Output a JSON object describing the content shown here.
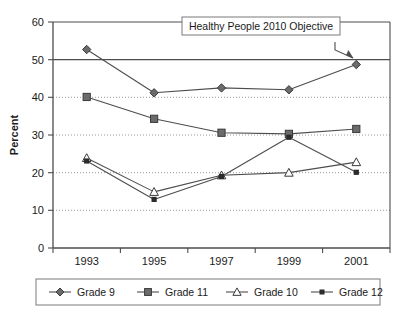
{
  "chart_data": {
    "type": "line",
    "title": "",
    "xlabel": "",
    "ylabel": "Percent",
    "categories": [
      "1993",
      "1995",
      "1997",
      "1999",
      "2001"
    ],
    "ylim": [
      0,
      60
    ],
    "ytick_labels": [
      "0",
      "10",
      "20",
      "30",
      "40",
      "50",
      "60"
    ],
    "ytick_values": [
      0,
      10,
      20,
      30,
      40,
      50,
      60
    ],
    "grid": "horizontal dotted gridlines at 10, 20, 30, 40; solid reference line at 50",
    "legend_position": "bottom",
    "series": [
      {
        "name": "Grade 9",
        "marker": "filled-diamond",
        "values": [
          52.7,
          41.2,
          42.5,
          42.0,
          48.7
        ]
      },
      {
        "name": "Grade 11",
        "marker": "filled-square",
        "values": [
          40.1,
          34.3,
          30.6,
          30.3,
          31.6
        ]
      },
      {
        "name": "Grade 10",
        "marker": "open-triangle",
        "values": [
          23.9,
          14.9,
          19.3,
          20.0,
          22.8
        ]
      },
      {
        "name": "Grade 12",
        "marker": "small-dot",
        "values": [
          23.1,
          12.9,
          19.0,
          29.4,
          20.1
        ]
      }
    ],
    "annotations": [
      {
        "text": "Healthy People 2010 Objective",
        "type": "callout-box-with-arrow",
        "points_to_value": 50,
        "points_to_category": "2001"
      }
    ],
    "reference_line": {
      "value": 50,
      "style": "solid",
      "label": "Healthy People 2010 Objective"
    },
    "colors": {
      "line": "#4d4d4d",
      "marker_fill": "#6b6b6b",
      "marker_open_fill": "#ffffff",
      "axis": "#4d4d4d",
      "gridline": "#9a9a9a",
      "text": "#1a1a1a",
      "legend_border": "#7a7a7a",
      "annotation_border": "#7a7a7a",
      "background": "#ffffff"
    }
  },
  "legend": {
    "items": [
      {
        "label": "Grade 9"
      },
      {
        "label": "Grade 11"
      },
      {
        "label": "Grade 10"
      },
      {
        "label": "Grade 12"
      }
    ]
  },
  "caption": {
    "partial_text": ""
  }
}
